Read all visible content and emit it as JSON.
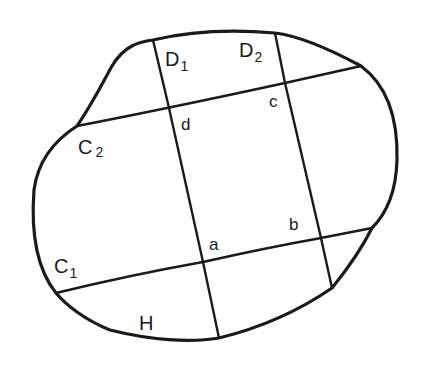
{
  "diagram": {
    "stroke_color": "#1a1a1a",
    "background": "#ffffff",
    "labels": {
      "D1": {
        "main": "D",
        "sub": "1"
      },
      "D2": {
        "main": "D",
        "sub": "2"
      },
      "C1": {
        "main": "C",
        "sub": "1"
      },
      "C2": {
        "main": "C",
        "sub": "2"
      },
      "a": "a",
      "b": "b",
      "c": "c",
      "d": "d",
      "H": "H"
    },
    "curves": [
      {
        "name": "C1",
        "from": [
          56,
          293
        ],
        "to": [
          372,
          228
        ]
      },
      {
        "name": "C2",
        "from": [
          77,
          126
        ],
        "to": [
          361,
          66
        ]
      },
      {
        "name": "D1",
        "from": [
          153,
          40
        ],
        "to": [
          219,
          338
        ]
      },
      {
        "name": "D2",
        "from": [
          275,
          33
        ],
        "to": [
          332,
          288
        ]
      }
    ],
    "intersections": {
      "a": [
        203,
        262
      ],
      "b": [
        321,
        238
      ],
      "c": [
        285,
        83
      ],
      "d": [
        169,
        108
      ]
    }
  }
}
